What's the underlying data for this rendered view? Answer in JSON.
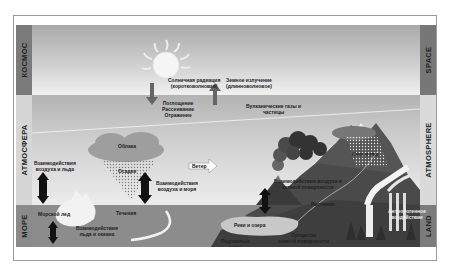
{
  "diagram": {
    "left_labels": [
      "КОСМОС",
      "АТМОСФЕРА",
      "МОРЕ"
    ],
    "right_labels": [
      "SPACE",
      "ATMOSPHERE",
      "LAND"
    ],
    "annotations": {
      "solar_radiation": [
        "Солнечная радиация",
        "(коротковолновая)"
      ],
      "earth_radiation": [
        "Земное излучение",
        "(длинноволновое)"
      ],
      "absorption": [
        "Поглощение",
        "Рассеивание",
        "Отражение"
      ],
      "volcanic_gases": [
        "Вулканические газы и",
        "частицы"
      ],
      "clouds": "Облака",
      "precipitation": "Осадки",
      "snow_ice": "Снег и лед",
      "wind": "Ветер",
      "air_ice": [
        "Взаимодействия",
        "воздуха и льда"
      ],
      "air_sea": [
        "Взаимодействия",
        "воздуха и моря"
      ],
      "air_land": [
        "Взаимодействия воздуха и",
        "земной поверхности"
      ],
      "sea_ice": "Морской лед",
      "currents": "Течения",
      "ice_ocean": [
        "Взаимодействия",
        "льда и океана"
      ],
      "rivers_lakes": "Реки и озера",
      "vegetation": "Растения",
      "groundwater": [
        "Подземные",
        "воды"
      ],
      "land_processes": [
        "Процессы",
        "земной поверхности"
      ],
      "human_activity": [
        "Антропогенное",
        "воздействие"
      ]
    },
    "colors": {
      "space_band": "#a9a9a9",
      "atmosphere_band": "#d0d0d0",
      "sea": "#8c8c8c",
      "land": "#4a4a4a",
      "frame_border": "#9a9a9a"
    }
  }
}
